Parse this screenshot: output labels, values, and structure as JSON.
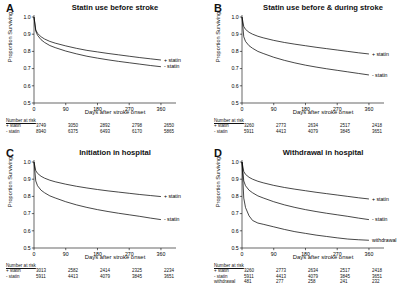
{
  "figure": {
    "axis": {
      "ylabel": "Proportion Surviving",
      "xlabel": "Days after stroke onset",
      "yticks": [
        "1.0",
        "0.9",
        "0.8",
        "0.7",
        "0.6",
        "0.5"
      ],
      "xticks": [
        "0",
        "90",
        "180",
        "270",
        "360"
      ],
      "ylim": [
        0.5,
        1.0
      ],
      "xlim": [
        0,
        380
      ],
      "risk_title": "Number at risk"
    },
    "panels": [
      {
        "letter": "A",
        "title": "Statin use before stroke",
        "risk_title": "Number at risk",
        "risk_times": [
          0,
          90,
          180,
          270,
          360
        ],
        "groups": [
          {
            "name": "+ statin",
            "label": "+ statin",
            "at_risk": [
              3749,
              3050,
              2892,
              2798,
              2650
            ]
          },
          {
            "name": "- statin",
            "label": "- statin",
            "at_risk": [
              8940,
              6375,
              6493,
              6170,
              5865
            ]
          }
        ]
      },
      {
        "letter": "B",
        "title": "Statin use before & during stroke",
        "risk_title": "Number at risk",
        "risk_times": [
          0,
          90,
          180,
          270,
          360
        ],
        "groups": [
          {
            "name": "+ statin",
            "label": "+ statin",
            "at_risk": [
              3260,
              2773,
              2634,
              2517,
              2418
            ]
          },
          {
            "name": "- statin",
            "label": "- statin",
            "at_risk": [
              5911,
              4413,
              4079,
              3845,
              3651
            ]
          }
        ]
      },
      {
        "letter": "C",
        "title": "Initiation in hospital",
        "risk_title": "Number at risk",
        "risk_times": [
          0,
          90,
          180,
          270,
          360
        ],
        "groups": [
          {
            "name": "+ statin",
            "label": "+ statin",
            "at_risk": [
              3013,
              2582,
              2414,
              2325,
              2234
            ]
          },
          {
            "name": "- statin",
            "label": "- statin",
            "at_risk": [
              5911,
              4413,
              4079,
              3845,
              3651
            ]
          }
        ]
      },
      {
        "letter": "D",
        "title": "Withdrawal in hospital",
        "risk_title": "Number at risk",
        "risk_times": [
          0,
          90,
          180,
          270,
          360
        ],
        "groups": [
          {
            "name": "+ statin",
            "label": "+ statin",
            "at_risk": [
              3260,
              2773,
              2634,
              2517,
              2418
            ]
          },
          {
            "name": "- statin",
            "label": "- statin",
            "at_risk": [
              5911,
              4413,
              4079,
              3845,
              3651
            ]
          },
          {
            "name": "withdrawal",
            "label": "withdrawal",
            "at_risk": [
              481,
              277,
              258,
              241,
              232
            ]
          }
        ]
      }
    ]
  },
  "chart_data": {
    "type": "line",
    "xlabel": "Days after stroke onset",
    "ylabel": "Proportion Surviving",
    "xlim": [
      0,
      380
    ],
    "ylim": [
      0.5,
      1.0
    ],
    "grid": false,
    "legend_position": "right-of-curve-end",
    "panels": [
      {
        "panel": "A",
        "title": "Statin use before stroke",
        "x": [
          0,
          5,
          10,
          20,
          30,
          45,
          60,
          90,
          120,
          150,
          180,
          210,
          240,
          270,
          300,
          330,
          360
        ],
        "series": [
          {
            "name": "+ statin",
            "values": [
              1.0,
              0.925,
              0.905,
              0.885,
              0.872,
              0.858,
              0.848,
              0.832,
              0.818,
              0.806,
              0.797,
              0.788,
              0.78,
              0.772,
              0.764,
              0.757,
              0.75
            ]
          },
          {
            "name": "- statin",
            "values": [
              1.0,
              0.918,
              0.894,
              0.868,
              0.852,
              0.834,
              0.822,
              0.802,
              0.786,
              0.772,
              0.761,
              0.751,
              0.742,
              0.734,
              0.726,
              0.718,
              0.711
            ]
          }
        ]
      },
      {
        "panel": "B",
        "title": "Statin use before & during stroke",
        "x": [
          0,
          5,
          10,
          20,
          30,
          45,
          60,
          90,
          120,
          150,
          180,
          210,
          240,
          270,
          300,
          330,
          360
        ],
        "series": [
          {
            "name": "+ statin",
            "values": [
              1.0,
              0.945,
              0.928,
              0.911,
              0.9,
              0.888,
              0.879,
              0.864,
              0.852,
              0.842,
              0.833,
              0.824,
              0.816,
              0.808,
              0.8,
              0.792,
              0.785
            ]
          },
          {
            "name": "- statin",
            "values": [
              1.0,
              0.885,
              0.858,
              0.833,
              0.818,
              0.8,
              0.788,
              0.766,
              0.748,
              0.733,
              0.72,
              0.709,
              0.699,
              0.69,
              0.681,
              0.672,
              0.663
            ]
          }
        ]
      },
      {
        "panel": "C",
        "title": "Initiation in hospital",
        "x": [
          0,
          5,
          10,
          20,
          30,
          45,
          60,
          90,
          120,
          150,
          180,
          210,
          240,
          270,
          300,
          330,
          360
        ],
        "series": [
          {
            "name": "+ statin",
            "values": [
              1.0,
              0.95,
              0.934,
              0.917,
              0.906,
              0.894,
              0.885,
              0.871,
              0.859,
              0.849,
              0.84,
              0.832,
              0.825,
              0.818,
              0.811,
              0.805,
              0.799
            ]
          },
          {
            "name": "- statin",
            "values": [
              1.0,
              0.89,
              0.862,
              0.836,
              0.821,
              0.803,
              0.791,
              0.769,
              0.751,
              0.736,
              0.723,
              0.712,
              0.702,
              0.693,
              0.684,
              0.674,
              0.665
            ]
          }
        ]
      },
      {
        "panel": "D",
        "title": "Withdrawal in hospital",
        "x": [
          0,
          5,
          10,
          20,
          30,
          45,
          60,
          90,
          120,
          150,
          180,
          210,
          240,
          270,
          300,
          330,
          360
        ],
        "series": [
          {
            "name": "+ statin",
            "values": [
              1.0,
              0.945,
              0.928,
              0.911,
              0.9,
              0.888,
              0.879,
              0.864,
              0.852,
              0.842,
              0.833,
              0.824,
              0.816,
              0.808,
              0.8,
              0.792,
              0.785
            ]
          },
          {
            "name": "- statin",
            "values": [
              1.0,
              0.89,
              0.862,
              0.836,
              0.821,
              0.803,
              0.791,
              0.769,
              0.751,
              0.736,
              0.723,
              0.712,
              0.702,
              0.693,
              0.684,
              0.674,
              0.665
            ]
          },
          {
            "name": "withdrawal",
            "values": [
              1.0,
              0.79,
              0.735,
              0.687,
              0.66,
              0.645,
              0.638,
              0.623,
              0.608,
              0.595,
              0.585,
              0.575,
              0.567,
              0.559,
              0.552,
              0.548,
              0.545
            ]
          }
        ]
      }
    ]
  }
}
